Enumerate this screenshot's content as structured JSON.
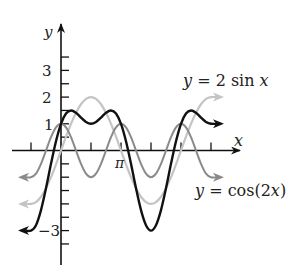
{
  "chart_data": {
    "type": "line",
    "title": "",
    "xlabel": "x",
    "ylabel": "y",
    "x_tick_labels": [
      {
        "value": 3.14159,
        "label": "π"
      }
    ],
    "x_ticks": [
      -1.5708,
      1.5708,
      3.14159,
      4.71239,
      6.28319,
      7.85398
    ],
    "y_tick_labels": [
      {
        "value": 3,
        "label": "3"
      },
      {
        "value": 2,
        "label": "2"
      },
      {
        "value": 1,
        "label": "1"
      },
      {
        "value": -3,
        "label": "−3"
      }
    ],
    "y_ticks": [
      3.5,
      3,
      2.5,
      2,
      1.5,
      1,
      0.5,
      -0.5,
      -1,
      -1.5,
      -2,
      -2.5,
      -3,
      -3.5
    ],
    "xlim": [
      -2.0,
      9.0
    ],
    "ylim": [
      -4.3,
      4.5
    ],
    "grid": false,
    "x_sample_step": "pi/12",
    "x_samples_k": [
      -6,
      -5,
      -4,
      -3,
      -2,
      -1,
      0,
      1,
      2,
      3,
      4,
      5,
      6,
      7,
      8,
      9,
      10,
      11,
      12,
      13,
      14,
      15,
      16,
      17,
      18,
      19,
      20,
      21,
      22,
      23,
      24,
      25,
      26,
      27,
      28,
      29,
      30
    ],
    "series": [
      {
        "name": "y = 2 sin x",
        "color": "#c4c4c4",
        "values": [
          -2,
          -1.932,
          -1.732,
          -1.414,
          -1,
          -0.518,
          0,
          0.518,
          1,
          1.414,
          1.732,
          1.932,
          2,
          1.932,
          1.732,
          1.414,
          1,
          0.518,
          0,
          -0.518,
          -1,
          -1.414,
          -1.732,
          -1.932,
          -2,
          -1.932,
          -1.732,
          -1.414,
          -1,
          -0.518,
          0,
          0.518,
          1,
          1.414,
          1.732,
          1.932,
          2
        ]
      },
      {
        "name": "y = cos(2x)",
        "color": "#8a8a8a",
        "values": [
          -1,
          -0.866,
          -0.5,
          0,
          0.5,
          0.866,
          1,
          0.866,
          0.5,
          0,
          -0.5,
          -0.866,
          -1,
          -0.866,
          -0.5,
          0,
          0.5,
          0.866,
          1,
          0.866,
          0.5,
          0,
          -0.5,
          -0.866,
          -1,
          -0.866,
          -0.5,
          0,
          0.5,
          0.866,
          1,
          0.866,
          0.5,
          0,
          -0.5,
          -0.866,
          -1
        ]
      },
      {
        "name": "y = 2 sin x + cos(2x)",
        "color": "#111111",
        "values": [
          -3,
          -2.798,
          -2.232,
          -1.414,
          -0.5,
          0.348,
          1,
          1.384,
          1.5,
          1.414,
          1.232,
          1.066,
          1,
          1.066,
          1.232,
          1.414,
          1.5,
          1.384,
          1,
          0.348,
          -0.5,
          -1.414,
          -2.232,
          -2.798,
          -3,
          -2.798,
          -2.232,
          -1.414,
          -0.5,
          0.348,
          1,
          1.384,
          1.5,
          1.414,
          1.232,
          1.066,
          1
        ]
      }
    ],
    "annotations": [
      {
        "text_parts": [
          "y",
          " = 2 sin ",
          "x"
        ],
        "near_series": "y = 2 sin x"
      },
      {
        "text_parts": [
          "y",
          " = cos(2",
          "x",
          ")"
        ],
        "near_series": "y = cos(2x)"
      }
    ]
  },
  "axes": {
    "x_label": "x",
    "y_label": "y",
    "pi_label": "π",
    "y_labels": {
      "three": "3",
      "two": "2",
      "one": "1",
      "neg_three": "−3"
    }
  },
  "labels": {
    "sin_label": {
      "y": "y",
      "eq": " = 2 sin ",
      "x": "x"
    },
    "cos_label": {
      "y": "y",
      "eq": " = cos(2",
      "x": "x",
      "close": ")"
    }
  }
}
